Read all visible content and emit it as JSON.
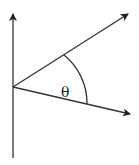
{
  "diagram": {
    "type": "angle-between-vectors",
    "angle_label": "θ",
    "stroke_color": "#333333",
    "vertex": [
      13,
      87
    ],
    "vertical_axis": {
      "from": [
        13,
        158
      ],
      "to": [
        13,
        14
      ]
    },
    "upper_ray": {
      "from": [
        13,
        87
      ],
      "to": [
        128,
        14
      ]
    },
    "lower_ray": {
      "from": [
        13,
        87
      ],
      "to": [
        130,
        114
      ]
    },
    "arc": {
      "start": [
        64,
        55
      ],
      "end": [
        87,
        104
      ]
    }
  }
}
